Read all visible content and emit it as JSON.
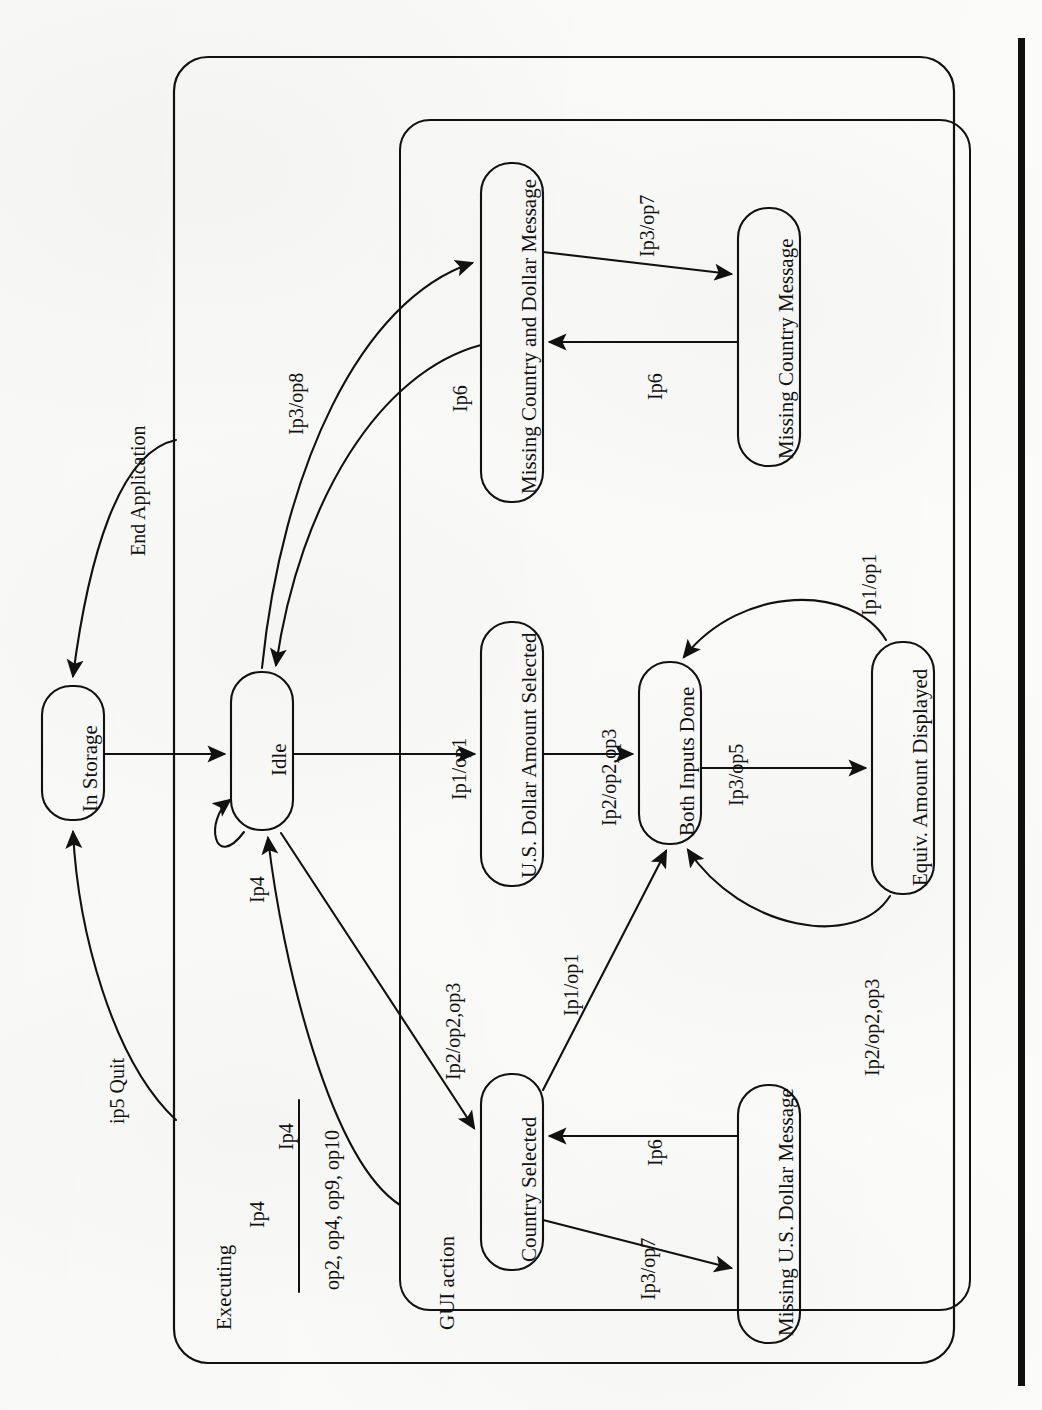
{
  "diagram": {
    "type": "uml-statechart",
    "orientation": "rotated-90-ccw",
    "title_visible": false,
    "regions": [
      {
        "id": "executing",
        "label": "Executing"
      },
      {
        "id": "gui-action",
        "label": "GUI action"
      }
    ],
    "states": [
      {
        "id": "in-storage",
        "label": "In Storage"
      },
      {
        "id": "idle",
        "label": "Idle"
      },
      {
        "id": "usd-amount",
        "label": "U.S. Dollar Amount Selected"
      },
      {
        "id": "both-inputs",
        "label": "Both Inputs Done"
      },
      {
        "id": "equiv-amount",
        "label": "Equiv. Amount Displayed"
      },
      {
        "id": "country-selected",
        "label": "Country Selected"
      },
      {
        "id": "missing-country-dollar",
        "label": "Missing Country and Dollar Message"
      },
      {
        "id": "missing-country",
        "label": "Missing Country Message"
      },
      {
        "id": "missing-usd",
        "label": "Missing U.S. Dollar Message"
      }
    ],
    "transitions": [
      {
        "id": "t-end-application",
        "from": "executing",
        "to": "in-storage",
        "label": "End Application"
      },
      {
        "id": "t-quit",
        "from": "executing",
        "to": "in-storage",
        "label": "ip5 Quit"
      },
      {
        "id": "t-storage-idle",
        "from": "in-storage",
        "to": "idle",
        "label": ""
      },
      {
        "id": "t-idle-self",
        "from": "idle",
        "to": "idle",
        "label": "Ip4"
      },
      {
        "id": "t-idle-return",
        "from": "gui-action",
        "to": "idle",
        "label": "Ip4"
      },
      {
        "id": "t-idle-usd",
        "from": "idle",
        "to": "usd-amount",
        "label": "Ip1/op1"
      },
      {
        "id": "t-usd-both",
        "from": "usd-amount",
        "to": "both-inputs",
        "label": "Ip2/op2,op3"
      },
      {
        "id": "t-both-equiv",
        "from": "both-inputs",
        "to": "equiv-amount",
        "label": "Ip3/op5"
      },
      {
        "id": "t-equiv-both-1",
        "from": "equiv-amount",
        "to": "both-inputs",
        "label": "Ip1/op1"
      },
      {
        "id": "t-equiv-both-2",
        "from": "equiv-amount",
        "to": "both-inputs",
        "label": "Ip2/op2,op3"
      },
      {
        "id": "t-idle-country",
        "from": "idle",
        "to": "country-selected",
        "label": "Ip2/op2,op3"
      },
      {
        "id": "t-country-both",
        "from": "country-selected",
        "to": "both-inputs",
        "label": "Ip1/op1"
      },
      {
        "id": "t-country-missusd",
        "from": "country-selected",
        "to": "missing-usd",
        "label": "Ip3/op7"
      },
      {
        "id": "t-missusd-country",
        "from": "missing-usd",
        "to": "country-selected",
        "label": "Ip6"
      },
      {
        "id": "t-idle-misscd",
        "from": "idle",
        "to": "missing-country-dollar",
        "label": "Ip3/op8"
      },
      {
        "id": "t-misscd-idle",
        "from": "missing-country-dollar",
        "to": "idle",
        "label": "Ip6"
      },
      {
        "id": "t-misscd-misscm",
        "from": "missing-country-dollar",
        "to": "missing-country",
        "label": "Ip3/op7"
      },
      {
        "id": "t-misscm-misscd",
        "from": "missing-country",
        "to": "missing-country-dollar",
        "label": "Ip6"
      }
    ],
    "fraction_label": {
      "id": "ip4-outputs",
      "numerator": "Ip4",
      "denominator": "op2, op4, op9, op10"
    },
    "colors": {
      "line": "#111111",
      "text": "#111111",
      "paper": "#fbfbf9",
      "page_edge": "#111111"
    }
  }
}
